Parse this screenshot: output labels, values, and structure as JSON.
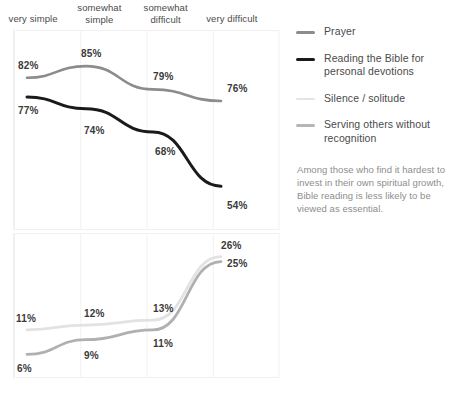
{
  "chart_data": {
    "type": "line",
    "title": "",
    "xlabel": "",
    "ylabel": "",
    "categories": [
      "very simple",
      "somewhat simple",
      "somewhat difficult",
      "very difficult"
    ],
    "grid": true,
    "legend_position": "right",
    "panels": [
      {
        "name": "upper-panel",
        "ylim": [
          45,
          92
        ],
        "series": [
          {
            "name": "Prayer",
            "color": "#8c8c8c",
            "width": 2.6,
            "values": [
              82,
              85,
              79,
              76
            ],
            "labels": [
              "82%",
              "85%",
              "79%",
              "76%"
            ]
          },
          {
            "name": "Reading the Bible for personal devotions",
            "color": "#1a1a1a",
            "width": 3.0,
            "values": [
              77,
              74,
              68,
              54
            ],
            "labels": [
              "77%",
              "74%",
              "68%",
              "54%"
            ]
          }
        ]
      },
      {
        "name": "lower-panel",
        "ylim": [
          3,
          29
        ],
        "series": [
          {
            "name": "Silence / solitude",
            "color": "#e2e2e2",
            "width": 2.8,
            "values": [
              11,
              12,
              13,
              26
            ],
            "labels": [
              "11%",
              "12%",
              "13%",
              "26%"
            ]
          },
          {
            "name": "Serving others without recognition",
            "color": "#b0b0b0",
            "width": 2.8,
            "values": [
              6,
              9,
              11,
              25
            ],
            "labels": [
              "6%",
              "9%",
              "11%",
              "25%"
            ]
          }
        ]
      }
    ]
  },
  "headers": {
    "items": [
      {
        "line1": "very simple",
        "line2": ""
      },
      {
        "line1": "somewhat",
        "line2": "simple"
      },
      {
        "line1": "somewhat",
        "line2": "difficult"
      },
      {
        "line1": "very difficult",
        "line2": ""
      }
    ]
  },
  "legend": {
    "items": [
      {
        "label": "Prayer",
        "color": "#8c8c8c",
        "thickness": "2.6px"
      },
      {
        "label": "Reading the Bible for personal devotions",
        "color": "#1a1a1a",
        "thickness": "3.4px"
      },
      {
        "label": "Silence / solitude",
        "color": "#e4e4e4",
        "thickness": "2.6px"
      },
      {
        "label": "Serving others without recognition",
        "color": "#b6b6b6",
        "thickness": "2.6px"
      }
    ]
  },
  "annotation": {
    "text": "Among those who find it hardest to invest in their own spiritual growth, Bible reading is less likely to be viewed as essential."
  }
}
